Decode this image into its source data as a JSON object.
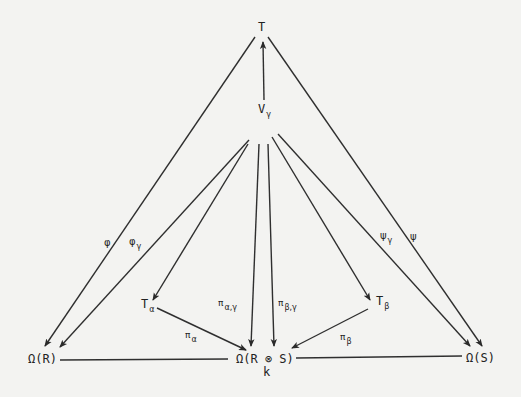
{
  "diagram": {
    "nodes": {
      "T": {
        "label": "T"
      },
      "V_gamma": {
        "base": "V",
        "sub": "γ"
      },
      "T_alpha": {
        "base": "T",
        "sub": "α"
      },
      "T_beta": {
        "base": "T",
        "sub": "β"
      },
      "Omega_R": {
        "label": "Ω(R)"
      },
      "Omega_RS": {
        "label": "Ω(R ⊗ S)",
        "below": "k"
      },
      "Omega_S": {
        "label": "Ω(S)"
      }
    },
    "edge_labels": {
      "phi": {
        "base": "φ",
        "sub": ""
      },
      "phi_gamma": {
        "base": "φ",
        "sub": "γ"
      },
      "psi": {
        "base": "ψ",
        "sub": ""
      },
      "psi_gamma": {
        "base": "ψ",
        "sub": "γ"
      },
      "pi_alpha_gamma": {
        "base": "π",
        "sub": "α,γ"
      },
      "pi_beta_gamma": {
        "base": "π",
        "sub": "β,γ"
      },
      "pi_alpha": {
        "base": "π",
        "sub": "α"
      },
      "pi_beta": {
        "base": "π",
        "sub": "β"
      }
    },
    "edges": [
      {
        "from": "V_gamma",
        "to": "T",
        "label": ""
      },
      {
        "from": "T",
        "to": "Omega_R",
        "label": "φ"
      },
      {
        "from": "T",
        "to": "Omega_S",
        "label": "ψ"
      },
      {
        "from": "V_gamma",
        "to": "Omega_R",
        "label": "φγ"
      },
      {
        "from": "V_gamma",
        "to": "Omega_S",
        "label": "ψγ"
      },
      {
        "from": "V_gamma",
        "to": "T_alpha",
        "label": ""
      },
      {
        "from": "V_gamma",
        "to": "T_beta",
        "label": ""
      },
      {
        "from": "V_gamma",
        "to": "Omega_RS",
        "label": "πα,γ"
      },
      {
        "from": "V_gamma",
        "to": "Omega_RS",
        "label": "πβ,γ"
      },
      {
        "from": "T_alpha",
        "to": "Omega_RS",
        "label": "πα"
      },
      {
        "from": "T_beta",
        "to": "Omega_RS",
        "label": "πβ"
      },
      {
        "from": "Omega_R",
        "to": "Omega_RS",
        "label": "",
        "style": "line"
      },
      {
        "from": "Omega_RS",
        "to": "Omega_S",
        "label": "",
        "style": "line"
      }
    ]
  }
}
